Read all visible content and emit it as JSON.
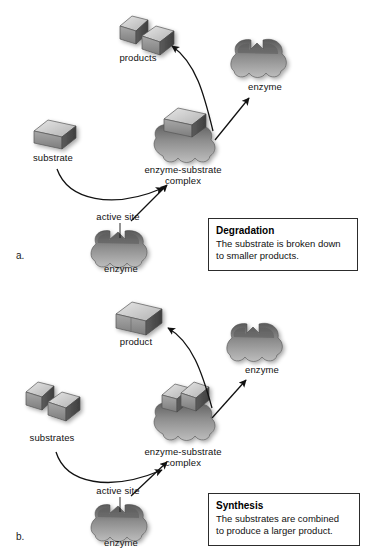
{
  "figure": {
    "background_color": "#ffffff",
    "width": 367,
    "height": 557
  },
  "panels": [
    {
      "letter": "a.",
      "name": "degradation-panel",
      "labels": {
        "products": "products",
        "enzyme_free": "enzyme",
        "substrate": "substrate",
        "complex_line1": "enzyme-substrate",
        "complex_line2": "complex",
        "active_site": "active site",
        "enzyme_bottom": "enzyme"
      },
      "callout": {
        "title": "Degradation",
        "body_line1": "The substrate is broken down",
        "body_line2": "to smaller products."
      }
    },
    {
      "letter": "b.",
      "name": "synthesis-panel",
      "labels": {
        "product": "product",
        "enzyme_free": "enzyme",
        "substrates": "substrates",
        "complex_line1": "enzyme-substrate",
        "complex_line2": "complex",
        "active_site": "active site",
        "enzyme_bottom": "enzyme"
      },
      "callout": {
        "title": "Synthesis",
        "body_line1": "The substrates are combined",
        "body_line2": "to produce a larger product."
      }
    }
  ],
  "colors": {
    "enzyme_dark": "#6e6e6e",
    "enzyme_mid": "#8e8e8e",
    "enzyme_light": "#b9b9b9",
    "block_top": "#d9d9d9",
    "block_face": "#9a9a9a",
    "block_side": "#6a6a6a",
    "arrow": "#111111",
    "text": "#111111",
    "callout_border": "#2c2c2c"
  }
}
